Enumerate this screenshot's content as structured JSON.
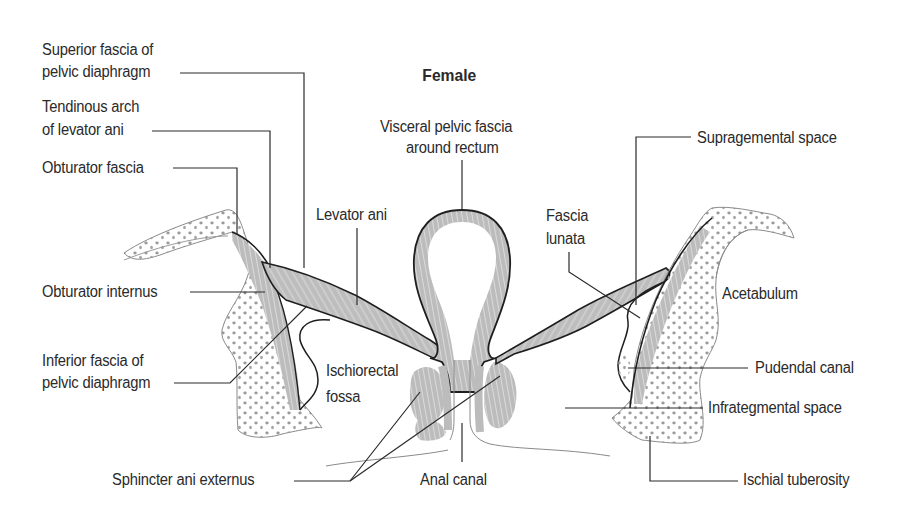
{
  "title": "Female",
  "labels": {
    "superior_fascia": [
      "Superior fascia of",
      "pelvic diaphragm"
    ],
    "tendinous_arch": [
      "Tendinous arch",
      "of levator ani"
    ],
    "obturator_fascia": "Obturator fascia",
    "obturator_internus": "Obturator internus",
    "inferior_fascia": [
      "Inferior fascia of",
      "pelvic diaphragm"
    ],
    "sphincter_ani_externus": "Sphincter ani externus",
    "anal_canal": "Anal canal",
    "visceral_fascia": [
      "Visceral pelvic fascia",
      "around rectum"
    ],
    "levator_ani": "Levator ani",
    "ischiorectal_fossa": [
      "Ischiorectal",
      "fossa"
    ],
    "fascia_lunata": [
      "Fascia",
      "lunata"
    ],
    "supragemental_space": "Supragemental space",
    "acetabulum": "Acetabulum",
    "pudendal_canal": "Pudendal canal",
    "infrategmental_space": "Infrategmental space",
    "ischial_tuberosity": "Ischial tuberosity"
  },
  "colors": {
    "outline": "#1e1e1e",
    "bone_outline": "#8a8a8a",
    "muscle_fill": "#b9b9b9",
    "bone_dots": "#9a9a9a",
    "leader": "#2a2a2a",
    "text": "#2a2a2a"
  }
}
